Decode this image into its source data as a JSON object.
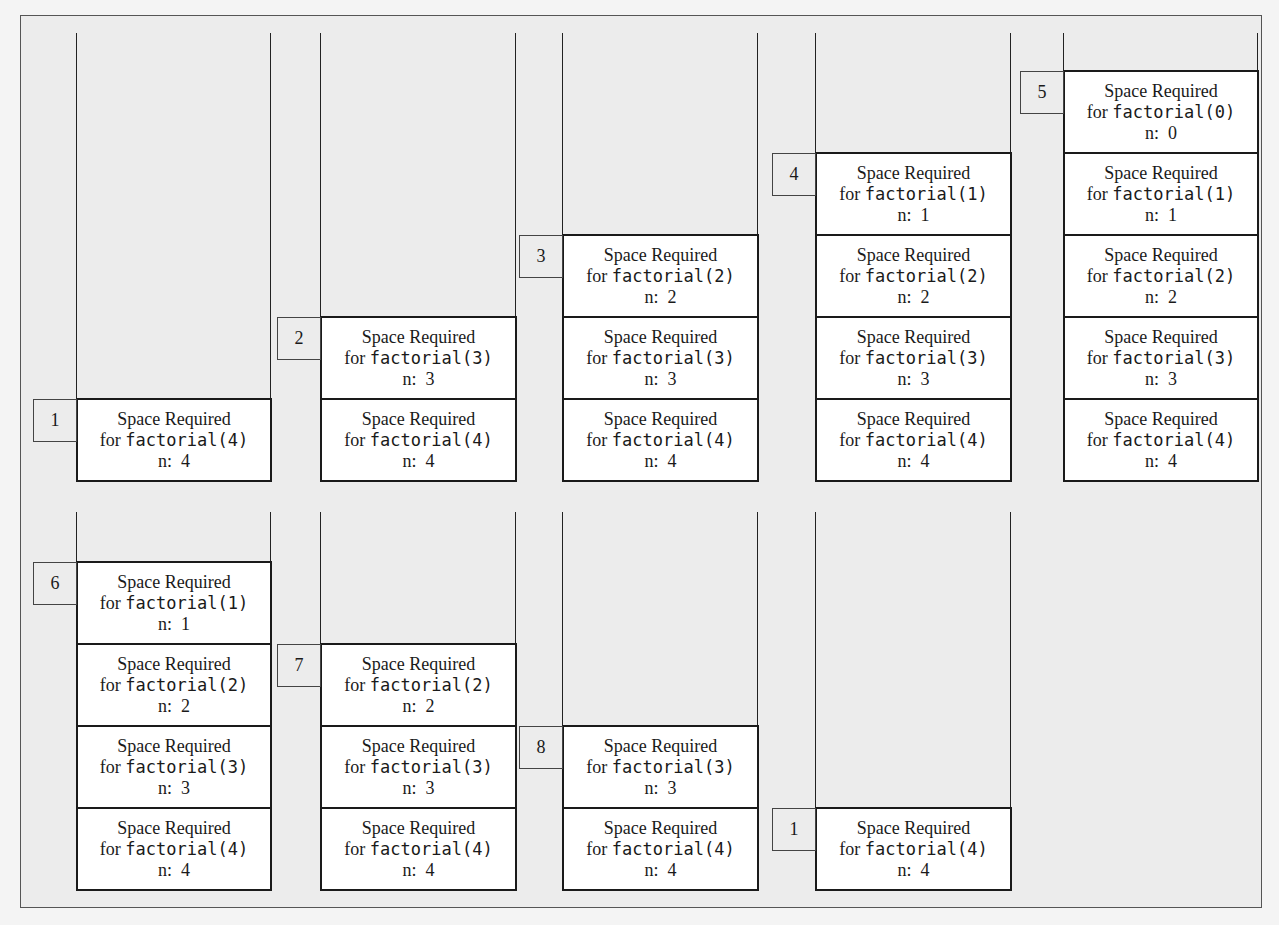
{
  "frame_text": {
    "line1": "Space Required",
    "line2_prefix": "for ",
    "n_prefix": "n:  "
  },
  "stacks": [
    {
      "step": "1",
      "row": 0,
      "frames": [
        {
          "call": "factorial(4)",
          "n": "4"
        }
      ]
    },
    {
      "step": "2",
      "row": 0,
      "frames": [
        {
          "call": "factorial(3)",
          "n": "3"
        },
        {
          "call": "factorial(4)",
          "n": "4"
        }
      ]
    },
    {
      "step": "3",
      "row": 0,
      "frames": [
        {
          "call": "factorial(2)",
          "n": "2"
        },
        {
          "call": "factorial(3)",
          "n": "3"
        },
        {
          "call": "factorial(4)",
          "n": "4"
        }
      ]
    },
    {
      "step": "4",
      "row": 0,
      "frames": [
        {
          "call": "factorial(1)",
          "n": "1"
        },
        {
          "call": "factorial(2)",
          "n": "2"
        },
        {
          "call": "factorial(3)",
          "n": "3"
        },
        {
          "call": "factorial(4)",
          "n": "4"
        }
      ]
    },
    {
      "step": "5",
      "row": 0,
      "frames": [
        {
          "call": "factorial(0)",
          "n": "0"
        },
        {
          "call": "factorial(1)",
          "n": "1"
        },
        {
          "call": "factorial(2)",
          "n": "2"
        },
        {
          "call": "factorial(3)",
          "n": "3"
        },
        {
          "call": "factorial(4)",
          "n": "4"
        }
      ]
    },
    {
      "step": "6",
      "row": 1,
      "frames": [
        {
          "call": "factorial(1)",
          "n": "1"
        },
        {
          "call": "factorial(2)",
          "n": "2"
        },
        {
          "call": "factorial(3)",
          "n": "3"
        },
        {
          "call": "factorial(4)",
          "n": "4"
        }
      ]
    },
    {
      "step": "7",
      "row": 1,
      "frames": [
        {
          "call": "factorial(2)",
          "n": "2"
        },
        {
          "call": "factorial(3)",
          "n": "3"
        },
        {
          "call": "factorial(4)",
          "n": "4"
        }
      ]
    },
    {
      "step": "8",
      "row": 1,
      "frames": [
        {
          "call": "factorial(3)",
          "n": "3"
        },
        {
          "call": "factorial(4)",
          "n": "4"
        }
      ]
    },
    {
      "step": "1",
      "row": 1,
      "frames": [
        {
          "call": "factorial(4)",
          "n": "4"
        }
      ]
    }
  ],
  "colors": {
    "background": "#ececec",
    "frame_fill": "#ffffff",
    "border": "#1a1a1a"
  }
}
